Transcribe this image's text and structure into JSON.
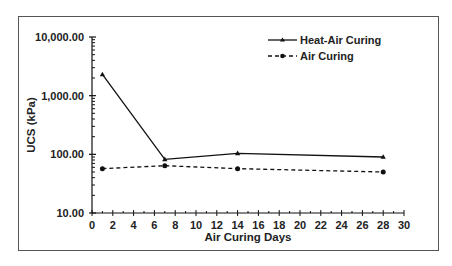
{
  "chart_data": {
    "type": "line",
    "title": "",
    "xlabel": "Air Curing Days",
    "ylabel": "UCS (kPa)",
    "yscale": "log",
    "xlim": [
      0,
      30
    ],
    "ylim": [
      10,
      10000
    ],
    "xticks": [
      0,
      2,
      4,
      6,
      8,
      10,
      12,
      14,
      16,
      18,
      20,
      22,
      24,
      26,
      28,
      30
    ],
    "yticks": [
      10,
      100,
      1000,
      10000
    ],
    "ytick_labels": [
      "10.00",
      "100.00",
      "1,000.00",
      "10,000.00"
    ],
    "grid": false,
    "legend_position": "upper right",
    "series": [
      {
        "name": "Heat-Air Curing",
        "style": "solid",
        "marker": "triangle",
        "x": [
          1,
          7,
          14,
          28
        ],
        "values": [
          2300,
          82,
          104,
          90
        ]
      },
      {
        "name": "Air Curing",
        "style": "dashed",
        "marker": "circle",
        "x": [
          1,
          7,
          14,
          28
        ],
        "values": [
          57,
          64,
          57,
          50
        ]
      }
    ]
  }
}
